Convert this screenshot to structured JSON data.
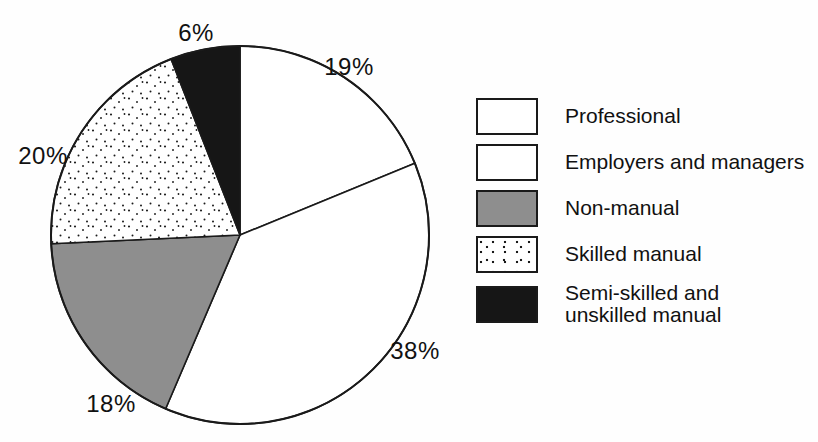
{
  "figure": {
    "background": "#fefefe"
  },
  "chart_data": {
    "type": "pie",
    "direction": "clockwise",
    "start_angle_deg": 0,
    "legend_position": "right",
    "grid": false,
    "colors": {
      "white": "#ffffff",
      "gray": "#8e8e8e",
      "black": "#161616",
      "stipple_dot": "#1a1a1a",
      "outline": "#1a1a1a"
    },
    "slices": [
      {
        "label": "Professional",
        "value": 19,
        "pct_label": "19%",
        "fill": "white",
        "label_pos": {
          "x": 349,
          "y": 67
        }
      },
      {
        "label": "Employers and managers",
        "value": 38,
        "pct_label": "38%",
        "fill": "white",
        "label_pos": {
          "x": 415,
          "y": 351
        }
      },
      {
        "label": "Non-manual",
        "value": 18,
        "pct_label": "18%",
        "fill": "gray",
        "label_pos": {
          "x": 111,
          "y": 404
        }
      },
      {
        "label": "Skilled manual",
        "value": 20,
        "pct_label": "20%",
        "fill": "stipple",
        "label_pos": {
          "x": 43,
          "y": 156
        }
      },
      {
        "label": "Semi-skilled and unskilled manual",
        "value": 6,
        "pct_label": "6%",
        "fill": "black",
        "label_pos": {
          "x": 196,
          "y": 33
        },
        "label_lines": [
          "Semi-skilled and",
          "unskilled manual"
        ]
      }
    ]
  }
}
